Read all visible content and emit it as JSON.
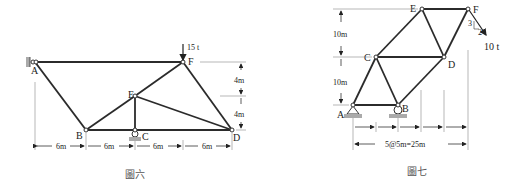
{
  "figure6": {
    "caption": "圖六",
    "load_label": "15 t",
    "joints": {
      "A": "A",
      "B": "B",
      "C": "C",
      "D": "D",
      "E": "E",
      "F": "F"
    },
    "horizontal_dims": [
      "6m",
      "6m",
      "6m",
      "6m"
    ],
    "vertical_dims": [
      "4m",
      "4m"
    ]
  },
  "figure7": {
    "caption": "圖七",
    "load_label": "10 t",
    "slope_rise": "3",
    "slope_run": "2",
    "joints": {
      "A": "A",
      "B": "B",
      "C": "C",
      "D": "D",
      "E": "E",
      "F": "F"
    },
    "vertical_dims": [
      "10m",
      "10m"
    ],
    "total_dim": "5@5m=25m"
  }
}
